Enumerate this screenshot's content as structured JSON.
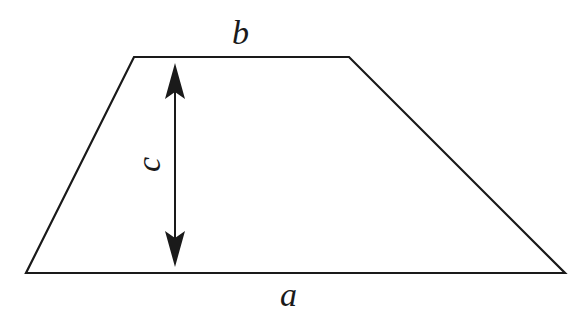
{
  "diagram": {
    "labels": {
      "top_base": "b",
      "bottom_base": "a",
      "height": "c"
    },
    "vertices": {
      "top_left": [
        134,
        57
      ],
      "top_right": [
        349,
        57
      ],
      "bottom_right": [
        565,
        273
      ],
      "bottom_left": [
        26,
        273
      ]
    },
    "height_arrow": {
      "x": 175,
      "y_top": 63,
      "y_bottom": 267
    },
    "stroke_color": "#1a1a1a",
    "background": "#ffffff"
  }
}
